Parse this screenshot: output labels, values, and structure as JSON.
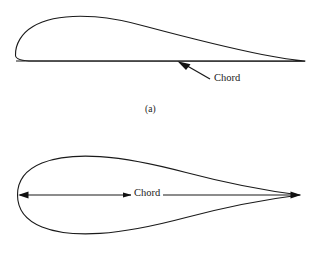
{
  "figure": {
    "background_color": "#ffffff",
    "line_color": "#1a1a1a",
    "panels": [
      {
        "id": "a",
        "caption": "(a)",
        "description": "cambered airfoil section with flat lower surface",
        "chord_label": "Chord",
        "leading_edge_x": 15,
        "trailing_edge_x": 305,
        "chord_line_y": 61,
        "max_thickness_y": 17,
        "max_thickness_x": 100
      },
      {
        "id": "b",
        "caption": "",
        "description": "symmetric airfoil section with double-headed chord dimension arrow",
        "chord_label": "Chord",
        "leading_edge_x": 17,
        "trailing_edge_x": 300,
        "chord_line_y": 195,
        "upper_surface_peak_y": 158,
        "lower_surface_peak_y": 232,
        "max_thickness_x": 100
      }
    ],
    "icons": {
      "arrow_left": "arrowhead-left-icon",
      "arrow_right": "arrowhead-right-icon",
      "leader_arrow": "leader-arrowhead-icon"
    }
  }
}
